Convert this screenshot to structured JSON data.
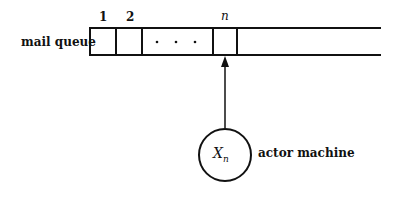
{
  "diagram": {
    "queue_label": "mail queue",
    "slot_labels": [
      "1",
      "2",
      "n"
    ],
    "ellipsis": "· · ·",
    "actor_symbol": "X",
    "actor_subscript": "n",
    "actor_label": "actor machine"
  }
}
